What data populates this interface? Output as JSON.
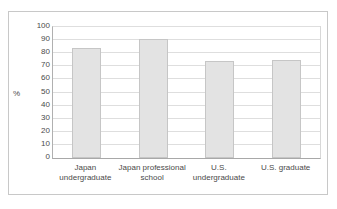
{
  "chart_data": {
    "type": "bar",
    "title": "",
    "subtitle": "",
    "xlabel": "",
    "ylabel": "%",
    "ylim": [
      0,
      100
    ],
    "ytick_step": 10,
    "yticks": [
      100,
      90,
      80,
      70,
      60,
      50,
      40,
      30,
      20,
      10,
      0
    ],
    "grid": true,
    "legend": null,
    "categories": [
      "Japan\nundergraduate",
      "Japan professional\nschool",
      "U.S.\nundergraduate",
      "U.S. graduate"
    ],
    "values": [
      84,
      91,
      74,
      75
    ],
    "bar_color": "#e3e3e3",
    "bar_border_color": "#c6c6c6",
    "gridline_color": "#dedede",
    "axis_color": "#a8a8a8",
    "text_color": "#4a4a4a",
    "frame_color": "#c8c8c8"
  }
}
